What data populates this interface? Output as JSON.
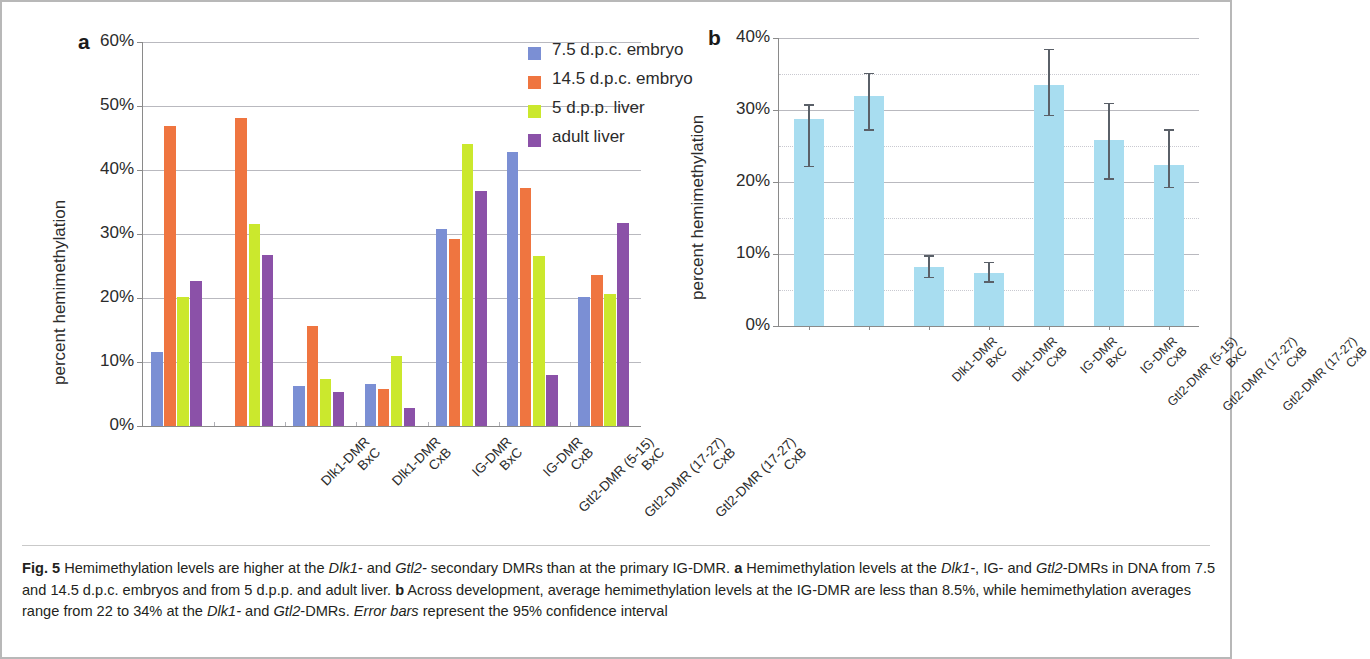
{
  "figure": {
    "number": "Fig. 5",
    "caption_runs": [
      {
        "text": "Fig. 5",
        "style": "bold"
      },
      {
        "text": "  Hemimethylation levels are higher at the ",
        "style": "normal"
      },
      {
        "text": "Dlk1-",
        "style": "italic"
      },
      {
        "text": " and ",
        "style": "normal"
      },
      {
        "text": "Gtl2-",
        "style": "italic"
      },
      {
        "text": " secondary DMRs than at the primary IG-DMR. ",
        "style": "normal"
      },
      {
        "text": "a",
        "style": "bold"
      },
      {
        "text": " Hemimethylation levels at the ",
        "style": "normal"
      },
      {
        "text": "Dlk1-",
        "style": "italic"
      },
      {
        "text": ", IG- and ",
        "style": "normal"
      },
      {
        "text": "Gtl2",
        "style": "italic"
      },
      {
        "text": "-DMRs in DNA from 7.5 and 14.5 d.p.c. embryos and from 5 d.p.p. and adult liver. ",
        "style": "normal"
      },
      {
        "text": "b",
        "style": "bold"
      },
      {
        "text": " Across development, average hemimethylation levels at the IG-DMR are less than 8.5%, while hemimethylation averages range from 22 to 34% at the ",
        "style": "normal"
      },
      {
        "text": "Dlk1-",
        "style": "italic"
      },
      {
        "text": " and ",
        "style": "normal"
      },
      {
        "text": "Gtl2",
        "style": "italic"
      },
      {
        "text": "-DMRs. ",
        "style": "normal"
      },
      {
        "text": "Error bars",
        "style": "italic"
      },
      {
        "text": " represent the 95% confidence interval",
        "style": "normal"
      }
    ]
  },
  "panel_a": {
    "letter": "a",
    "ylabel": "percent hemimethylation",
    "yticks": [
      "0%",
      "10%",
      "20%",
      "30%",
      "40%",
      "50%",
      "60%"
    ],
    "legend": [
      {
        "label": "7.5 d.p.c. embryo",
        "color": "#7b8fd4"
      },
      {
        "label": "14.5 d.p.c. embryo",
        "color": "#ef7540"
      },
      {
        "label": "5 d.p.p. liver",
        "color": "#cbe82d"
      },
      {
        "label": "adult liver",
        "color": "#8b51a8"
      }
    ]
  },
  "panel_b": {
    "letter": "b",
    "ylabel": "percent hemimethylation",
    "yticks": [
      "0%",
      "10%",
      "20%",
      "30%",
      "40%"
    ],
    "bar_color": "#a8ddf0"
  },
  "chart_data": [
    {
      "type": "bar",
      "panel": "a",
      "title": "",
      "xlabel": "",
      "ylabel": "percent hemimethylation",
      "ylim": [
        0,
        60
      ],
      "ytick_values": [
        0,
        10,
        20,
        30,
        40,
        50,
        60
      ],
      "grid": true,
      "legend_position": "top-right",
      "categories": [
        "Dlk1-DMR\nBxC",
        "Dlk1-DMR\nCxB",
        "IG-DMR\nBxC",
        "IG-DMR\nCxB",
        "Gtl2-DMR (5-15)\nBxC",
        "Gtl2-DMR (17-27)\nCxB",
        "Gtl2-DMR (17-27)\nCxB"
      ],
      "series": [
        {
          "name": "7.5 d.p.c. embryo",
          "color": "#7b8fd4",
          "values": [
            11.5,
            0,
            6.3,
            6.5,
            30.8,
            42.8,
            20.2
          ]
        },
        {
          "name": "14.5 d.p.c. embryo",
          "color": "#ef7540",
          "values": [
            46.8,
            48.2,
            15.6,
            5.8,
            29.2,
            37.2,
            23.6
          ]
        },
        {
          "name": "5 d.p.p. liver",
          "color": "#cbe82d",
          "values": [
            20.2,
            31.5,
            7.3,
            11.0,
            44.0,
            26.6,
            20.6
          ]
        },
        {
          "name": "adult liver",
          "color": "#8b51a8",
          "values": [
            22.7,
            26.7,
            5.3,
            2.8,
            36.7,
            8.0,
            31.7
          ]
        }
      ]
    },
    {
      "type": "bar",
      "panel": "b",
      "title": "",
      "xlabel": "",
      "ylabel": "percent hemimethylation",
      "ylim": [
        0,
        40
      ],
      "ytick_values": [
        0,
        10,
        20,
        30,
        40
      ],
      "minor_gridlines": [
        5,
        15,
        25,
        35
      ],
      "grid": true,
      "error_bar_note": "95% confidence interval",
      "categories": [
        "Dlk1-DMR\nBxC",
        "Dlk1-DMR\nCxB",
        "IG-DMR\nBxC",
        "IG-DMR\nCxB",
        "Gtl2-DMR (5-15)\nBxC",
        "Gtl2-DMR (17-27)\nCxB",
        "Gtl2-DMR (17-27)\nCxB"
      ],
      "values": [
        28.7,
        32.0,
        8.2,
        7.3,
        33.5,
        25.8,
        22.3
      ],
      "err_lower": [
        22.2,
        27.3,
        6.8,
        6.2,
        29.3,
        20.5,
        19.3
      ],
      "err_upper": [
        30.8,
        35.2,
        9.8,
        8.9,
        38.5,
        31.0,
        27.3
      ],
      "color": "#a8ddf0"
    }
  ]
}
